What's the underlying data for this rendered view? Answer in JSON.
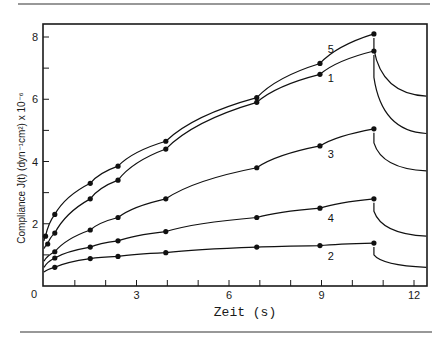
{
  "chart_data": {
    "type": "line",
    "title": "",
    "xlabel": "Zeit (s)",
    "ylabel": "Compliance J(t) (dyn⁻¹cm²) x 10⁻⁶",
    "xlim": [
      0,
      12.4
    ],
    "ylim": [
      0,
      8.4
    ],
    "xticks": [
      0,
      1,
      2,
      3,
      4,
      5,
      6,
      7,
      8,
      9,
      10,
      11,
      12
    ],
    "xtick_labels": [
      {
        "value": 0,
        "label": "0"
      },
      {
        "value": 3,
        "label": "3"
      },
      {
        "value": 6,
        "label": "6"
      },
      {
        "value": 9,
        "label": "9"
      },
      {
        "value": 12,
        "label": "12"
      }
    ],
    "yticks": [
      1,
      2,
      3,
      4,
      5,
      6,
      7,
      8
    ],
    "ytick_labels": [
      {
        "value": 2,
        "label": "2"
      },
      {
        "value": 4,
        "label": "4"
      },
      {
        "value": 6,
        "label": "6"
      },
      {
        "value": 8,
        "label": "8"
      }
    ],
    "origin_label": "0",
    "grid": false,
    "load_removed_at": 10.7,
    "series": [
      {
        "name": "5",
        "x": [
          0.05,
          0.35,
          1.5,
          2.4,
          3.95,
          6.9,
          8.95,
          10.7
        ],
        "y": [
          1.6,
          2.3,
          3.3,
          3.85,
          4.65,
          6.05,
          7.15,
          8.1
        ],
        "start_y": 1.45,
        "label_at": [
          9.3,
          7.5
        ],
        "recovery": {
          "drop_to": 7.6,
          "end_x": 12.4,
          "end_y": 6.1
        }
      },
      {
        "name": "1",
        "x": [
          0.12,
          0.35,
          1.5,
          2.4,
          3.95,
          6.9,
          8.95,
          10.7
        ],
        "y": [
          1.35,
          1.7,
          2.8,
          3.4,
          4.4,
          5.9,
          6.8,
          7.55
        ],
        "start_y": 1.2,
        "label_at": [
          9.3,
          6.55
        ],
        "recovery": {
          "drop_to": 6.7,
          "end_x": 12.4,
          "end_y": 4.9
        }
      },
      {
        "name": "3",
        "x": [
          0.35,
          1.5,
          2.4,
          3.95,
          6.9,
          8.95,
          10.7
        ],
        "y": [
          1.1,
          1.8,
          2.2,
          2.8,
          3.8,
          4.5,
          5.05
        ],
        "start_y": 0.8,
        "label_at": [
          9.3,
          4.1
        ],
        "recovery": {
          "drop_to": 4.6,
          "end_x": 12.4,
          "end_y": 3.7
        }
      },
      {
        "name": "4",
        "x": [
          0.35,
          1.5,
          2.4,
          3.95,
          6.9,
          8.95,
          10.7
        ],
        "y": [
          0.9,
          1.25,
          1.45,
          1.75,
          2.2,
          2.5,
          2.8
        ],
        "start_y": 0.6,
        "label_at": [
          9.3,
          2.05
        ],
        "recovery": {
          "drop_to": 2.4,
          "end_x": 12.4,
          "end_y": 1.6
        }
      },
      {
        "name": "2",
        "x": [
          0.35,
          1.5,
          2.4,
          3.95,
          6.9,
          8.95,
          10.7
        ],
        "y": [
          0.6,
          0.88,
          0.95,
          1.07,
          1.25,
          1.3,
          1.38
        ],
        "start_y": 0.45,
        "label_at": [
          9.3,
          0.85
        ],
        "recovery": {
          "drop_to": 1.0,
          "end_x": 12.4,
          "end_y": 0.6
        }
      }
    ],
    "legend": "inline labels near curves, right side"
  }
}
